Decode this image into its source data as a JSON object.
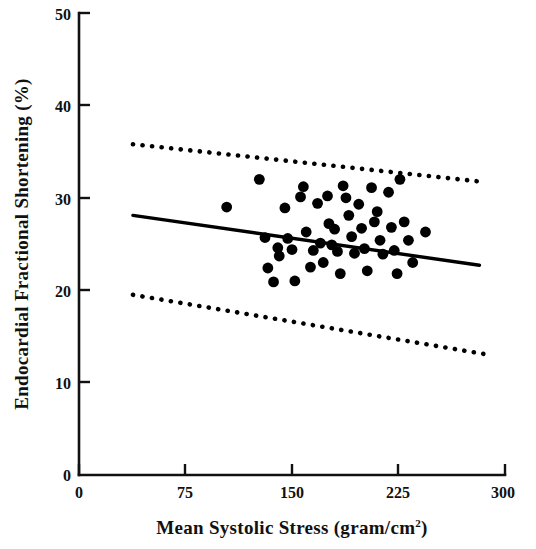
{
  "figure": {
    "background_color": "#ffffff",
    "foreground_color": "#000000"
  },
  "chart_data": {
    "type": "scatter",
    "title": "",
    "xlabel": "Mean Systolic Stress (gram/cm",
    "xlabel_superscript": "2",
    "xlabel_suffix": ")",
    "ylabel": "Endocardial Fractional Shortening (%)",
    "xlim": [
      0,
      300
    ],
    "ylim": [
      0,
      50
    ],
    "xticks": [
      0,
      75,
      150,
      225,
      300
    ],
    "xtick_labels": [
      "0",
      "75",
      "150",
      "225",
      "300"
    ],
    "yticks": [
      0,
      10,
      20,
      30,
      40,
      50
    ],
    "ytick_labels": [
      "0",
      "10",
      "20",
      "30",
      "40",
      "50"
    ],
    "grid": false,
    "legend": null,
    "marker": "filled-circle",
    "marker_color": "#000000",
    "points": [
      {
        "x": 104,
        "y": 29.0
      },
      {
        "x": 127,
        "y": 32.0
      },
      {
        "x": 131,
        "y": 25.7
      },
      {
        "x": 133,
        "y": 22.4
      },
      {
        "x": 137,
        "y": 20.9
      },
      {
        "x": 140,
        "y": 24.6
      },
      {
        "x": 141,
        "y": 23.7
      },
      {
        "x": 145,
        "y": 28.9
      },
      {
        "x": 147,
        "y": 25.6
      },
      {
        "x": 150,
        "y": 24.4
      },
      {
        "x": 152,
        "y": 21.0
      },
      {
        "x": 156,
        "y": 30.1
      },
      {
        "x": 158,
        "y": 31.2
      },
      {
        "x": 160,
        "y": 26.3
      },
      {
        "x": 163,
        "y": 22.5
      },
      {
        "x": 165,
        "y": 24.3
      },
      {
        "x": 168,
        "y": 29.4
      },
      {
        "x": 170,
        "y": 25.1
      },
      {
        "x": 172,
        "y": 23.0
      },
      {
        "x": 175,
        "y": 30.2
      },
      {
        "x": 176,
        "y": 27.2
      },
      {
        "x": 178,
        "y": 24.9
      },
      {
        "x": 180,
        "y": 26.6
      },
      {
        "x": 182,
        "y": 24.2
      },
      {
        "x": 184,
        "y": 21.8
      },
      {
        "x": 186,
        "y": 31.3
      },
      {
        "x": 188,
        "y": 30.0
      },
      {
        "x": 190,
        "y": 28.1
      },
      {
        "x": 192,
        "y": 25.8
      },
      {
        "x": 194,
        "y": 24.0
      },
      {
        "x": 197,
        "y": 29.3
      },
      {
        "x": 199,
        "y": 26.7
      },
      {
        "x": 201,
        "y": 24.5
      },
      {
        "x": 203,
        "y": 22.1
      },
      {
        "x": 206,
        "y": 31.1
      },
      {
        "x": 208,
        "y": 27.4
      },
      {
        "x": 210,
        "y": 28.5
      },
      {
        "x": 212,
        "y": 25.4
      },
      {
        "x": 214,
        "y": 23.9
      },
      {
        "x": 218,
        "y": 30.6
      },
      {
        "x": 220,
        "y": 26.8
      },
      {
        "x": 222,
        "y": 24.3
      },
      {
        "x": 224,
        "y": 21.8
      },
      {
        "x": 226,
        "y": 32.0
      },
      {
        "x": 229,
        "y": 27.4
      },
      {
        "x": 232,
        "y": 25.4
      },
      {
        "x": 235,
        "y": 23.0
      },
      {
        "x": 244,
        "y": 26.3
      }
    ],
    "regression_line": {
      "label": "regression",
      "style": "solid",
      "x0": 38,
      "y0": 28.1,
      "x1": 282,
      "y1": 22.7
    },
    "confidence_bands": [
      {
        "label": "upper-confidence-limit",
        "style": "dotted",
        "x0": 38,
        "y0": 35.8,
        "x1": 286,
        "y1": 31.7
      },
      {
        "label": "lower-confidence-limit",
        "style": "dotted",
        "x0": 38,
        "y0": 19.5,
        "x1": 289,
        "y1": 13.0
      }
    ]
  }
}
